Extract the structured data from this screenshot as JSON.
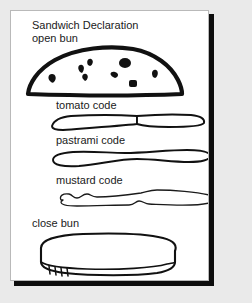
{
  "canvas": {
    "width": 252,
    "height": 303,
    "background_color": "#eaeaea",
    "card_background": "#ffffff",
    "card_border_color": "#b9b9b9",
    "shadow_color": "#0d0d0d",
    "ink_color": "#111111"
  },
  "diagram": {
    "title": "Sandwich Declaration",
    "type": "layered-sandwich-diagram",
    "layers": [
      {
        "id": "open-bun",
        "label": "open bun",
        "shape": "dome-with-sesame-seeds",
        "stroke_weight": "thick",
        "seed_count": 8
      },
      {
        "id": "tomato",
        "label": "tomato code",
        "shape": "two-overlapping-slices",
        "stroke_weight": "medium"
      },
      {
        "id": "pastrami",
        "label": "pastrami code",
        "shape": "long-wavy-slab",
        "stroke_weight": "medium"
      },
      {
        "id": "mustard",
        "label": "mustard code",
        "shape": "irregular-squiggle-smear",
        "stroke_weight": "thin"
      },
      {
        "id": "close-bun",
        "label": "close bun",
        "shape": "rounded-3d-slab-with-hatching",
        "stroke_weight": "medium"
      }
    ]
  }
}
